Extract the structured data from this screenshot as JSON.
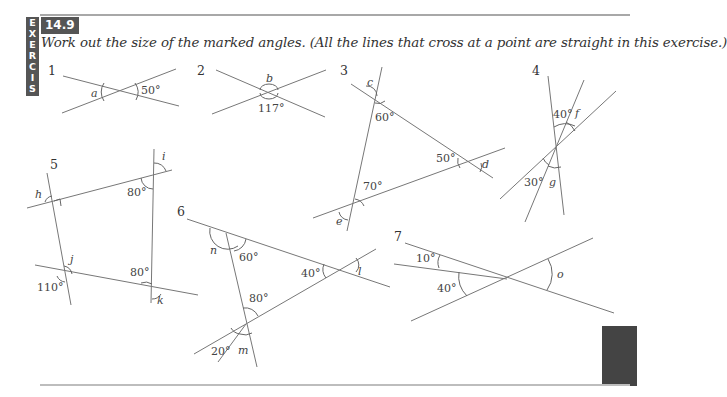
{
  "sidebar": {
    "letters": [
      "E",
      "X",
      "E",
      "R",
      "C",
      "I",
      "S",
      "E"
    ]
  },
  "exercise": {
    "number": "14.9",
    "instruction": "Work out the size of the marked angles. (All the lines that cross at a point are straight in this exercise.)"
  },
  "questions": [
    {
      "number": "1",
      "given": [
        "50°"
      ],
      "unknowns": [
        "a"
      ]
    },
    {
      "number": "2",
      "given": [
        "117°"
      ],
      "unknowns": [
        "b"
      ]
    },
    {
      "number": "3",
      "given": [
        "60°",
        "50°",
        "70°"
      ],
      "unknowns": [
        "c",
        "d",
        "e"
      ]
    },
    {
      "number": "4",
      "given": [
        "40°",
        "30°"
      ],
      "unknowns": [
        "f",
        "g"
      ]
    },
    {
      "number": "5",
      "given": [
        "80°",
        "80°",
        "110°"
      ],
      "unknowns": [
        "h",
        "i",
        "j",
        "k"
      ]
    },
    {
      "number": "6",
      "given": [
        "60°",
        "40°",
        "80°",
        "20°"
      ],
      "unknowns": [
        "n",
        "l",
        "m"
      ]
    },
    {
      "number": "7",
      "given": [
        "10°",
        "40°"
      ],
      "unknowns": [
        "o"
      ]
    }
  ],
  "labels": {
    "q1": {
      "num": "1",
      "a": "a",
      "g1": "50°"
    },
    "q2": {
      "num": "2",
      "b": "b",
      "g1": "117°"
    },
    "q3": {
      "num": "3",
      "c": "c",
      "d": "d",
      "e": "e",
      "g1": "60°",
      "g2": "50°",
      "g3": "70°"
    },
    "q4": {
      "num": "4",
      "f": "f",
      "g": "g",
      "g1": "40°",
      "g2": "30°"
    },
    "q5": {
      "num": "5",
      "h": "h",
      "i": "i",
      "j": "j",
      "k": "k",
      "g1": "80°",
      "g2": "80°",
      "g3": "110°"
    },
    "q6": {
      "num": "6",
      "n": "n",
      "l": "l",
      "m": "m",
      "g1": "60°",
      "g2": "40°",
      "g3": "80°",
      "g4": "20°"
    },
    "q7": {
      "num": "7",
      "o": "o",
      "g1": "10°",
      "g2": "40°"
    }
  }
}
